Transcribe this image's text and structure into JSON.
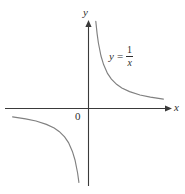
{
  "figure": {
    "name": "hyperbola-graph",
    "background_color": "#ffffff",
    "width": 185,
    "height": 194
  },
  "axes": {
    "x_label": "x",
    "y_label": "y",
    "origin_label": "0",
    "axis_color": "#3a3a3a",
    "x_axis": {
      "y_px": 108,
      "x_start_px": 5,
      "x_end_px": 170
    },
    "y_axis": {
      "x_px": 88,
      "y_start_px": 22,
      "y_end_px": 186
    }
  },
  "annotation": {
    "equation_lhs": "y",
    "equation_relation": "=",
    "equation_numerator": "1",
    "equation_denominator": "x",
    "equation_plain": "y = 1/x"
  },
  "chart_data": {
    "type": "line",
    "title": "",
    "subtitle": "",
    "xlabel": "x",
    "ylabel": "y",
    "function": "y = 1/x",
    "curve_color": "#808080",
    "grid": false,
    "legend": "none",
    "annotations": [
      {
        "text": "y = 1/x",
        "x_px": 109,
        "y_px": 45
      },
      {
        "text": "0",
        "x_px": 75,
        "y_px": 111
      }
    ],
    "axis_origin_px": {
      "x": 88,
      "y": 108
    },
    "px_per_unit": {
      "x": 26,
      "y": 26
    },
    "xlim": [
      -3.2,
      3.2
    ],
    "ylim": [
      -3.3,
      3.3
    ],
    "series": [
      {
        "name": "branch-upper-right",
        "quadrant": 1,
        "x": [
          0.3,
          0.35,
          0.4,
          0.5,
          0.6,
          0.75,
          0.9,
          1.1,
          1.3,
          1.6,
          2.0,
          2.4,
          2.9
        ],
        "y": [
          3.33,
          2.86,
          2.5,
          2.0,
          1.67,
          1.33,
          1.11,
          0.91,
          0.77,
          0.63,
          0.5,
          0.42,
          0.34
        ]
      },
      {
        "name": "branch-lower-left",
        "quadrant": 3,
        "x": [
          -2.9,
          -2.4,
          -2.0,
          -1.6,
          -1.3,
          -1.1,
          -0.9,
          -0.75,
          -0.6,
          -0.5,
          -0.4,
          -0.35
        ],
        "y": [
          -0.34,
          -0.42,
          -0.5,
          -0.63,
          -0.77,
          -0.91,
          -1.11,
          -1.33,
          -1.67,
          -2.0,
          -2.5,
          -2.86
        ]
      }
    ]
  }
}
